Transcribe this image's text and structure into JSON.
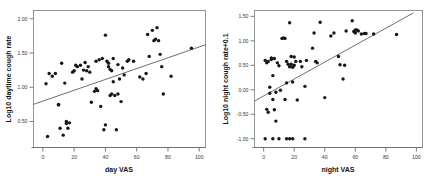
{
  "figure": {
    "background": "#ffffff",
    "point_color": "#161616",
    "line_color": "#4a4a4a",
    "frame_color": "#8a8a8a"
  },
  "chart_data": [
    {
      "type": "scatter",
      "name": "daytime-cough-vs-day-vas",
      "title": "",
      "xlabel": "day VAS",
      "ylabel": "Log10 daytime cough rate",
      "xlim": [
        -6,
        104
      ],
      "ylim": [
        0.12,
        2.12
      ],
      "xticks": [
        0,
        20,
        40,
        60,
        80,
        100
      ],
      "xticklabels": [
        "0",
        "20",
        "40",
        "60",
        "80",
        "100"
      ],
      "yticks": [
        0.5,
        1.0,
        1.5,
        2.0
      ],
      "yticklabels": [
        "0.50",
        "1.00",
        "1.50",
        "2.00"
      ],
      "grid": false,
      "legend": "none",
      "fit_line": {
        "x": [
          -6,
          104
        ],
        "y": [
          0.75,
          1.62
        ]
      },
      "x": [
        2,
        3,
        4,
        6,
        8,
        10,
        10,
        11,
        12,
        13,
        14,
        15,
        15,
        16,
        17,
        19,
        20,
        21,
        22,
        24,
        25,
        26,
        27,
        28,
        29,
        30,
        31,
        33,
        34,
        34,
        35,
        36,
        37,
        38,
        39,
        40,
        40,
        41,
        42,
        42,
        43,
        43,
        44,
        44,
        45,
        45,
        46,
        47,
        48,
        48,
        49,
        50,
        51,
        52,
        54,
        55,
        58,
        62,
        64,
        66,
        67,
        68,
        70,
        71,
        72,
        73,
        74,
        75,
        76,
        77,
        82,
        95
      ],
      "y": [
        1.05,
        0.28,
        1.2,
        1.16,
        1.2,
        0.75,
        0.74,
        0.4,
        1.35,
        0.3,
        1.06,
        0.5,
        0.47,
        0.4,
        0.48,
        1.22,
        1.24,
        1.32,
        1.3,
        1.32,
        1.12,
        1.25,
        1.36,
        1.24,
        1.3,
        1.22,
        0.78,
        0.94,
        0.98,
        1.38,
        0.95,
        1.4,
        0.72,
        1.42,
        0.38,
        0.45,
        1.76,
        1.38,
        1.3,
        1.35,
        1.26,
        0.88,
        1.24,
        0.9,
        1.42,
        1.08,
        0.88,
        0.38,
        1.33,
        0.9,
        1.12,
        0.79,
        1.28,
        1.18,
        1.38,
        1.4,
        1.38,
        1.15,
        1.12,
        1.2,
        1.77,
        1.45,
        1.83,
        1.68,
        1.7,
        1.87,
        1.68,
        1.48,
        1.3,
        0.9,
        1.16,
        1.57
      ]
    },
    {
      "type": "scatter",
      "name": "night-cough-vs-night-vas",
      "title": "",
      "xlabel": "night VAS",
      "ylabel": "Log10 night cough rate+0.1",
      "xlim": [
        -6,
        104
      ],
      "ylim": [
        -1.18,
        1.62
      ],
      "xticks": [
        0,
        20,
        40,
        60,
        80,
        100
      ],
      "xticklabels": [
        "0",
        "20",
        "40",
        "60",
        "80",
        "100"
      ],
      "yticks": [
        -1.0,
        -0.5,
        0.0,
        0.5,
        1.0,
        1.5
      ],
      "yticklabels": [
        "-1.00",
        "-0.50",
        "0.00",
        "0.50",
        "1.00",
        "1.50"
      ],
      "grid": false,
      "legend": "none",
      "fit_line": {
        "x": [
          -6,
          98
        ],
        "y": [
          -0.23,
          1.57
        ]
      },
      "x": [
        1,
        2,
        2,
        3,
        3,
        4,
        4,
        5,
        5,
        6,
        6,
        7,
        7,
        8,
        8,
        9,
        10,
        11,
        12,
        13,
        14,
        14,
        15,
        15,
        16,
        17,
        17,
        18,
        18,
        19,
        19,
        20,
        20,
        21,
        22,
        24,
        25,
        27,
        28,
        32,
        33,
        34,
        35,
        37,
        40,
        44,
        46,
        49,
        50,
        52,
        53,
        54,
        58,
        59,
        60,
        60,
        61,
        62,
        64,
        66,
        67,
        72,
        87,
        1,
        6,
        10,
        15,
        17,
        19,
        27
      ],
      "y": [
        0.6,
        0.55,
        -0.4,
        0.58,
        -0.46,
        -0.07,
        0.05,
        0.62,
        0.65,
        0.29,
        -0.2,
        0.64,
        -0.41,
        -0.05,
        -0.64,
        0.55,
        0.49,
        -0.01,
        1.05,
        1.06,
        1.05,
        -0.2,
        0.58,
        0.14,
        0.52,
        1.37,
        0.47,
        0.68,
        0.52,
        0.46,
        0.16,
        0.67,
        0.5,
        0.58,
        -0.21,
        0.58,
        0.47,
        0.07,
        0.6,
        0.85,
        1.16,
        0.58,
        0.55,
        1.38,
        -0.16,
        1.1,
        1.16,
        0.68,
        0.51,
        0.22,
        0.5,
        1.2,
        1.41,
        1.19,
        1.22,
        1.16,
        1.22,
        1.2,
        1.14,
        1.15,
        1.15,
        1.14,
        1.13,
        -1.0,
        -1.0,
        -1.0,
        -1.0,
        -1.0,
        -1.0,
        -1.0
      ]
    }
  ]
}
